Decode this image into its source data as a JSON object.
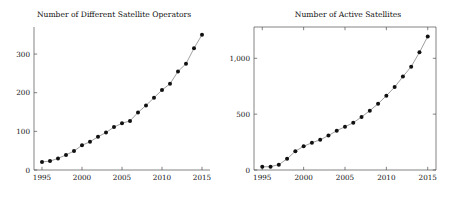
{
  "figure": {
    "background_color": "#ffffff",
    "marker_color": "#111111",
    "line_color": "#6b6b6b",
    "axis_color": "#4d4d4d"
  },
  "chart_data": [
    {
      "type": "line",
      "title": "Number of Different Satellite Operators",
      "xlabel": "",
      "ylabel": "",
      "xlim": [
        1994,
        2016
      ],
      "ylim": [
        0,
        370
      ],
      "grid": false,
      "legend": false,
      "frame": "left-bottom",
      "xticks": [
        1995,
        2000,
        2005,
        2010,
        2015
      ],
      "xtick_labels": [
        "1995",
        "2000",
        "2005",
        "2010",
        "2015"
      ],
      "yticks": [
        0,
        100,
        200,
        300
      ],
      "ytick_labels": [
        "0",
        "100",
        "200",
        "300"
      ],
      "x": [
        1995,
        1996,
        1997,
        1998,
        1999,
        2000,
        2001,
        2002,
        2003,
        2004,
        2005,
        2006,
        2007,
        2008,
        2009,
        2010,
        2011,
        2012,
        2013,
        2014,
        2015
      ],
      "values": [
        21,
        23,
        30,
        39,
        49,
        64,
        73,
        86,
        97,
        111,
        121,
        127,
        149,
        167,
        187,
        207,
        223,
        255,
        275,
        315,
        350
      ]
    },
    {
      "type": "line",
      "title": "Number of Active Satellites",
      "xlabel": "",
      "ylabel": "",
      "xlim": [
        1994,
        2016
      ],
      "ylim": [
        0,
        1280
      ],
      "grid": false,
      "legend": false,
      "frame": "full-box",
      "xticks": [
        1995,
        2000,
        2005,
        2010,
        2015
      ],
      "xtick_labels": [
        "1995",
        "2000",
        "2005",
        "2010",
        "2015"
      ],
      "yticks": [
        0,
        500,
        1000
      ],
      "ytick_labels": [
        "0",
        "500",
        "1,000"
      ],
      "x": [
        1995,
        1996,
        1997,
        1998,
        1999,
        2000,
        2001,
        2002,
        2003,
        2004,
        2005,
        2006,
        2007,
        2008,
        2009,
        2010,
        2011,
        2012,
        2013,
        2014,
        2015
      ],
      "values": [
        28,
        30,
        48,
        100,
        168,
        212,
        244,
        270,
        308,
        352,
        387,
        423,
        475,
        531,
        593,
        665,
        742,
        836,
        925,
        1053,
        1195
      ]
    }
  ]
}
